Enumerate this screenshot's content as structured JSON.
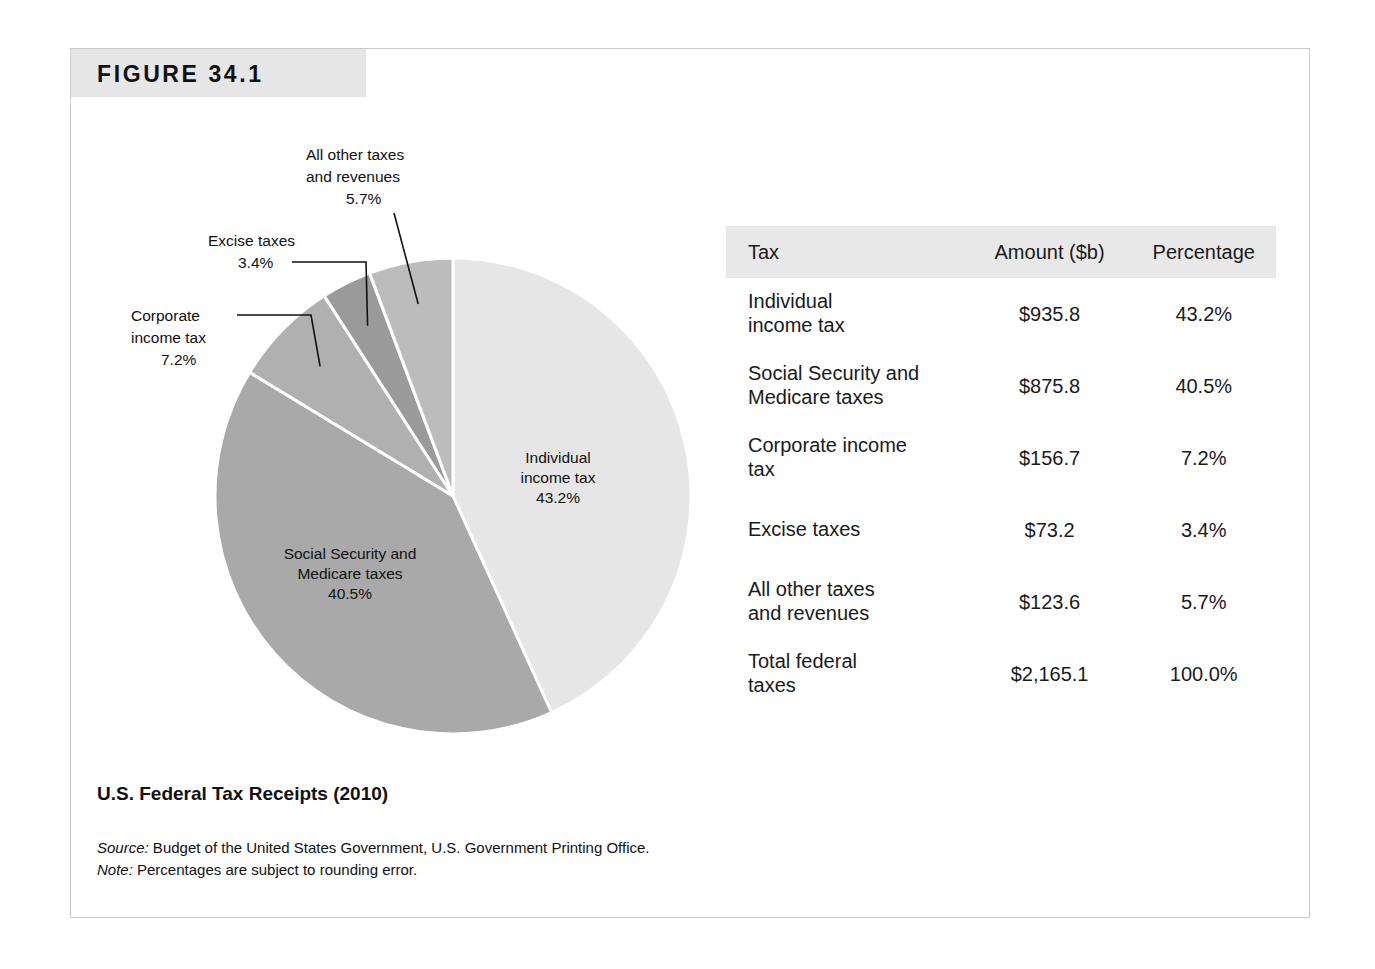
{
  "figure": {
    "number": "FIGURE 34.1",
    "caption": "U.S. Federal Tax Receipts (2010)",
    "source_label": "Source:",
    "source_text": " Budget of the United States Government, U.S. Government Printing Office.",
    "note_label": "Note:",
    "note_text": " Percentages are subject to rounding error."
  },
  "table": {
    "columns": [
      "Tax",
      "Amount ($b)",
      "Percentage"
    ],
    "rows": [
      {
        "label_line1": "Individual",
        "label_line2": "income tax",
        "amount": "$935.8",
        "percentage": "43.2%"
      },
      {
        "label_line1": "Social Security and",
        "label_line2": "Medicare taxes",
        "amount": "$875.8",
        "percentage": "40.5%"
      },
      {
        "label_line1": "Corporate income",
        "label_line2": "tax",
        "amount": "$156.7",
        "percentage": "7.2%"
      },
      {
        "label_line1": "Excise taxes",
        "label_line2": "",
        "amount": "$73.2",
        "percentage": "3.4%"
      },
      {
        "label_line1": "All other taxes",
        "label_line2": "and revenues",
        "amount": "$123.6",
        "percentage": "5.7%"
      },
      {
        "label_line1": "Total federal",
        "label_line2": "taxes",
        "amount": "$2,165.1",
        "percentage": "100.0%"
      }
    ]
  },
  "pie_labels": {
    "individual": {
      "line1": "Individual",
      "line2": "income tax",
      "line3": "43.2%"
    },
    "social": {
      "line1": "Social Security and",
      "line2": "Medicare taxes",
      "line3": "40.5%"
    },
    "corporate": {
      "line1": "Corporate",
      "line2": "income tax",
      "line3": "7.2%"
    },
    "excise": {
      "line1": "Excise taxes",
      "line2": "3.4%"
    },
    "allother": {
      "line1": "All other taxes",
      "line2": "and revenues",
      "line3": "5.7%"
    }
  },
  "chart_data": {
    "type": "pie",
    "title": "U.S. Federal Tax Receipts (2010)",
    "unit": "$ billions",
    "total_label": "Total federal taxes",
    "total_amount": 2165.1,
    "legend_position": "none",
    "start_angle_deg": 0,
    "direction": "clockwise",
    "labels": [
      "Individual income tax",
      "Social Security and Medicare taxes",
      "Corporate income tax",
      "Excise taxes",
      "All other taxes and revenues"
    ],
    "values": [
      935.8,
      875.8,
      156.7,
      73.2,
      123.6
    ],
    "percentages": [
      43.2,
      40.5,
      7.2,
      3.4,
      5.7
    ],
    "colors": [
      "#e6e6e6",
      "#a9a9a9",
      "#b0b0b0",
      "#9a9a9a",
      "#bcbcbc"
    ],
    "slice_gap_color": "#ffffff"
  }
}
